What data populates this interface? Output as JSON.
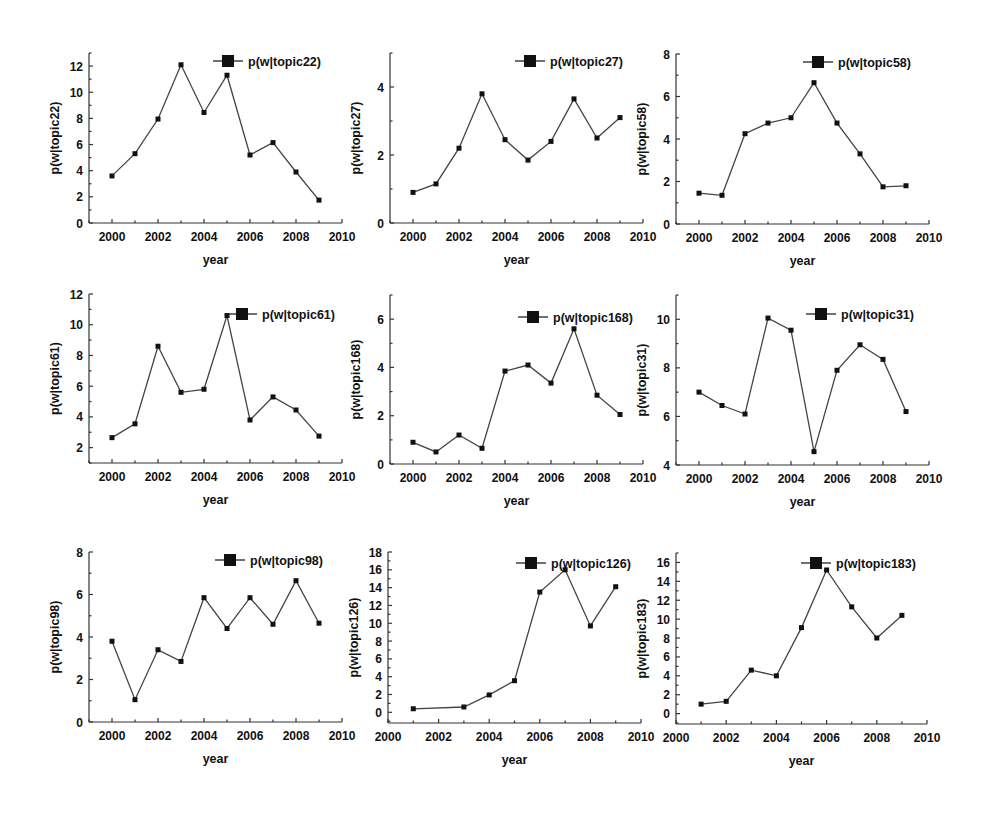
{
  "chart_data": [
    {
      "type": "line",
      "title": "",
      "legend": "p(w|topic22)",
      "xlabel": "year",
      "ylabel": "p(w|topic22)",
      "xlim": [
        1999,
        2010
      ],
      "ylim": [
        0,
        13
      ],
      "xticks": [
        2000,
        2002,
        2004,
        2006,
        2008,
        2010
      ],
      "yticks": [
        0,
        2,
        4,
        6,
        8,
        10,
        12
      ],
      "x": [
        2000,
        2001,
        2002,
        2003,
        2004,
        2005,
        2006,
        2007,
        2008,
        2009
      ],
      "y": [
        3.6,
        5.3,
        7.95,
        12.1,
        8.45,
        11.3,
        5.2,
        6.15,
        3.9,
        1.75
      ],
      "box": {
        "left": 89,
        "top": 53,
        "right": 342,
        "bottom": 223
      },
      "legend_pos": {
        "x": 213,
        "y": 61
      }
    },
    {
      "type": "line",
      "title": "",
      "legend": "p(w|topic27)",
      "xlabel": "year",
      "ylabel": "p(w|topic27)",
      "xlim": [
        1999,
        2010
      ],
      "ylim": [
        0,
        5
      ],
      "xticks": [
        2000,
        2002,
        2004,
        2006,
        2008,
        2010
      ],
      "yticks": [
        0,
        2,
        4
      ],
      "x": [
        2000,
        2001,
        2002,
        2003,
        2004,
        2005,
        2006,
        2007,
        2008,
        2009
      ],
      "y": [
        0.9,
        1.15,
        2.2,
        3.8,
        2.45,
        1.85,
        2.4,
        3.65,
        2.5,
        3.1
      ],
      "box": {
        "left": 390,
        "top": 53,
        "right": 643,
        "bottom": 223
      },
      "legend_pos": {
        "x": 515,
        "y": 61
      }
    },
    {
      "type": "line",
      "title": "",
      "legend": "p(w|topic58)",
      "xlabel": "year",
      "ylabel": "p(w|topic58)",
      "xlim": [
        1999,
        2010
      ],
      "ylim": [
        0,
        8
      ],
      "xticks": [
        2000,
        2002,
        2004,
        2006,
        2008,
        2010
      ],
      "yticks": [
        0,
        2,
        4,
        6,
        8
      ],
      "x": [
        2000,
        2001,
        2002,
        2003,
        2004,
        2005,
        2006,
        2007,
        2008,
        2009
      ],
      "y": [
        1.45,
        1.35,
        4.25,
        4.75,
        5.0,
        6.65,
        4.75,
        3.3,
        1.75,
        1.8
      ],
      "box": {
        "left": 676,
        "top": 54,
        "right": 929,
        "bottom": 224
      },
      "legend_pos": {
        "x": 803,
        "y": 62
      }
    },
    {
      "type": "line",
      "title": "",
      "legend": "p(w|topic61)",
      "xlabel": "year",
      "ylabel": "p(w|topic61)",
      "xlim": [
        1999,
        2010
      ],
      "ylim": [
        1,
        12
      ],
      "xticks": [
        2000,
        2002,
        2004,
        2006,
        2008,
        2010
      ],
      "yticks": [
        2,
        4,
        6,
        8,
        10,
        12
      ],
      "x": [
        2000,
        2001,
        2002,
        2003,
        2004,
        2005,
        2006,
        2007,
        2008,
        2009
      ],
      "y": [
        2.65,
        3.55,
        8.6,
        5.6,
        5.8,
        10.6,
        3.8,
        5.3,
        4.45,
        2.75
      ],
      "box": {
        "left": 89,
        "top": 294,
        "right": 342,
        "bottom": 463
      },
      "legend_pos": {
        "x": 227,
        "y": 314
      }
    },
    {
      "type": "line",
      "title": "",
      "legend": "p(w|topic168)",
      "xlabel": "year",
      "ylabel": "p(w|topic168)",
      "xlim": [
        1999,
        2010
      ],
      "ylim": [
        0,
        7
      ],
      "xticks": [
        2000,
        2002,
        2004,
        2006,
        2008,
        2010
      ],
      "yticks": [
        0,
        2,
        4,
        6
      ],
      "x": [
        2000,
        2001,
        2002,
        2003,
        2004,
        2005,
        2006,
        2007,
        2008,
        2009
      ],
      "y": [
        0.9,
        0.5,
        1.2,
        0.65,
        3.85,
        4.1,
        3.35,
        5.6,
        2.85,
        2.05
      ],
      "box": {
        "left": 390,
        "top": 295,
        "right": 643,
        "bottom": 464
      },
      "legend_pos": {
        "x": 518,
        "y": 317
      }
    },
    {
      "type": "line",
      "title": "",
      "legend": "p(w|topic31)",
      "xlabel": "year",
      "ylabel": "p(w|topic31)",
      "xlim": [
        1999,
        2010
      ],
      "ylim": [
        4,
        11
      ],
      "xticks": [
        2000,
        2002,
        2004,
        2006,
        2008,
        2010
      ],
      "yticks": [
        4,
        6,
        8,
        10
      ],
      "x": [
        2000,
        2001,
        2002,
        2003,
        2004,
        2005,
        2006,
        2007,
        2008,
        2009
      ],
      "y": [
        7.0,
        6.45,
        6.1,
        10.05,
        9.55,
        4.55,
        7.9,
        8.95,
        8.35,
        6.2
      ],
      "box": {
        "left": 676,
        "top": 295,
        "right": 929,
        "bottom": 465
      },
      "legend_pos": {
        "x": 806,
        "y": 314
      }
    },
    {
      "type": "line",
      "title": "",
      "legend": "p(w|topic98)",
      "xlabel": "year",
      "ylabel": "p(w|topic98)",
      "xlim": [
        1999,
        2010
      ],
      "ylim": [
        0,
        8
      ],
      "xticks": [
        2000,
        2002,
        2004,
        2006,
        2008,
        2010
      ],
      "yticks": [
        0,
        2,
        4,
        6,
        8
      ],
      "x": [
        2000,
        2001,
        2002,
        2003,
        2004,
        2005,
        2006,
        2007,
        2008,
        2009
      ],
      "y": [
        3.8,
        1.05,
        3.4,
        2.85,
        5.85,
        4.4,
        5.85,
        4.6,
        6.65,
        4.65
      ],
      "box": {
        "left": 89,
        "top": 552,
        "right": 342,
        "bottom": 722
      },
      "legend_pos": {
        "x": 215,
        "y": 560
      }
    },
    {
      "type": "line",
      "title": "",
      "legend": "p(w|topic126)",
      "xlabel": "year",
      "ylabel": "p(w|topic126)",
      "xlim": [
        2000,
        2010
      ],
      "ylim": [
        -1.2,
        18
      ],
      "xticks": [
        2000,
        2002,
        2004,
        2006,
        2008,
        2010
      ],
      "yticks": [
        0,
        2,
        4,
        6,
        8,
        10,
        12,
        14,
        16,
        18
      ],
      "x": [
        2001,
        2003,
        2004,
        2005,
        2006,
        2007,
        2008,
        2009
      ],
      "y": [
        0.4,
        0.6,
        1.95,
        3.55,
        13.5,
        16.0,
        9.7,
        14.1
      ],
      "box": {
        "left": 388,
        "top": 552,
        "right": 641,
        "bottom": 723
      },
      "legend_pos": {
        "x": 516,
        "y": 563
      }
    },
    {
      "type": "line",
      "title": "",
      "legend": "p(w|topic183)",
      "xlabel": "year",
      "ylabel": "p(w|topic183)",
      "xlim": [
        2000,
        2010
      ],
      "ylim": [
        -1.1,
        17
      ],
      "xticks": [
        2000,
        2002,
        2004,
        2006,
        2008,
        2010
      ],
      "yticks": [
        0,
        2,
        4,
        6,
        8,
        10,
        12,
        14,
        16
      ],
      "x": [
        2001,
        2002,
        2003,
        2004,
        2005,
        2006,
        2007,
        2008,
        2009
      ],
      "y": [
        1.0,
        1.3,
        4.6,
        4.0,
        9.1,
        15.2,
        11.3,
        8.0,
        10.4
      ],
      "box": {
        "left": 676,
        "top": 553,
        "right": 927,
        "bottom": 724
      },
      "legend_pos": {
        "x": 801,
        "y": 563
      }
    }
  ]
}
